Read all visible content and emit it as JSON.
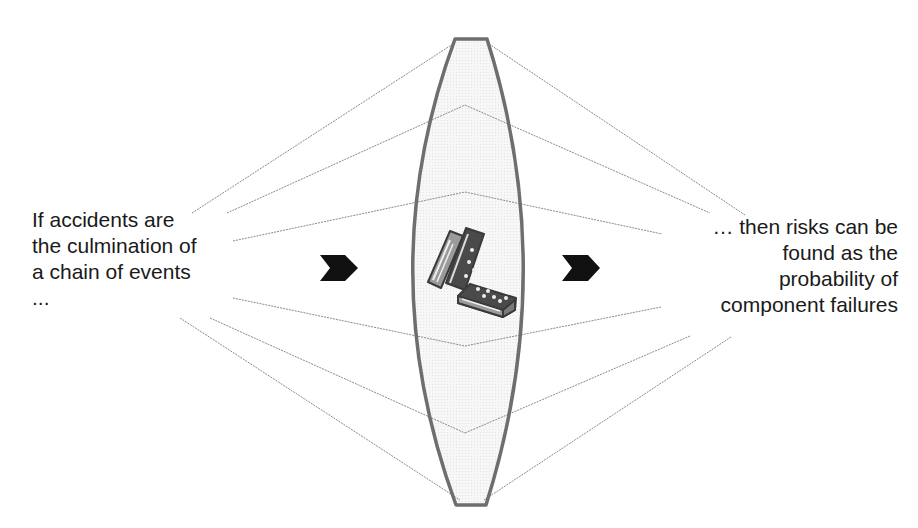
{
  "left_text": {
    "lines": [
      "If accidents are",
      "the culmination of",
      "a chain of events",
      "..."
    ]
  },
  "right_text": {
    "lines": [
      "… then risks can be",
      "found as the",
      "probability of",
      "component failures"
    ]
  },
  "center": {
    "lens_shape": "convex-lens",
    "icon": "dominoes-icon"
  },
  "arrows": [
    "arrow-right-icon",
    "arrow-right-icon"
  ],
  "colors": {
    "lens_outline": "#6e6e6e",
    "lens_fill": "#f3f3f3",
    "ray_lines": "#8a8a8a",
    "arrow": "#111111",
    "text": "#1a1a1a"
  }
}
